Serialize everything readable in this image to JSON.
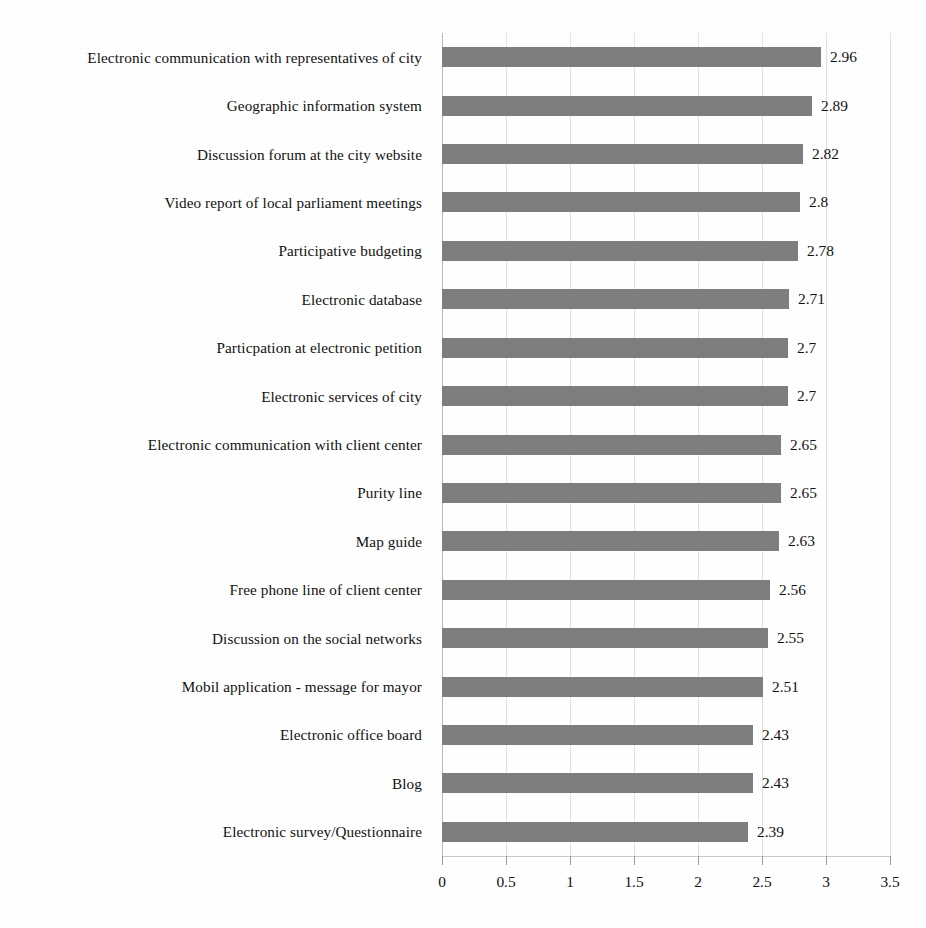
{
  "chart_data": {
    "type": "bar",
    "orientation": "horizontal",
    "title": "",
    "subtitle": "",
    "xlabel": "",
    "ylabel": "",
    "xlim": [
      0,
      3.5
    ],
    "xticks": [
      "0",
      "0.5",
      "1",
      "1.5",
      "2",
      "2.5",
      "3",
      "3.5"
    ],
    "xtick_values": [
      0,
      0.5,
      1,
      1.5,
      2,
      2.5,
      3,
      3.5
    ],
    "grid": "vertical",
    "legend": "none",
    "bar_color": "#7e7e7e",
    "categories": [
      "Electronic communication with representatives of city",
      "Geographic information system",
      "Discussion forum at the city website",
      "Video report of local parliament meetings",
      "Participative budgeting",
      "Electronic database",
      "Particpation at electronic petition",
      "Electronic services of city",
      "Electronic communication with client center",
      "Purity line",
      "Map guide",
      "Free phone line of client center",
      "Discussion on the social networks",
      "Mobil application - message for mayor",
      "Electronic office board",
      "Blog",
      "Electronic survey/Questionnaire"
    ],
    "values": [
      2.96,
      2.89,
      2.82,
      2.8,
      2.78,
      2.71,
      2.7,
      2.7,
      2.65,
      2.65,
      2.63,
      2.56,
      2.55,
      2.51,
      2.43,
      2.43,
      2.39
    ],
    "value_labels": [
      "2.96",
      "2.89",
      "2.82",
      "2.8",
      "2.78",
      "2.71",
      "2.7",
      "2.7",
      "2.65",
      "2.65",
      "2.63",
      "2.56",
      "2.55",
      "2.51",
      "2.43",
      "2.43",
      "2.39"
    ]
  }
}
